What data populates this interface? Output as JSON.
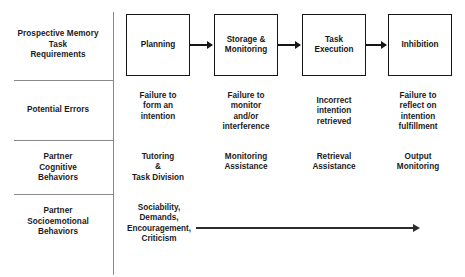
{
  "diagram": {
    "row_labels": [
      {
        "id": "pm-task-requirements",
        "text": "Prospective Memory\nTask\nRequirements"
      },
      {
        "id": "potential-errors",
        "text": "Potential Errors"
      },
      {
        "id": "partner-cognitive-behaviors",
        "text": "Partner\nCognitive\nBehaviors"
      },
      {
        "id": "partner-socioemotional-behaviors",
        "text": "Partner\nSocioemotional\nBehaviors"
      }
    ],
    "stages": [
      {
        "id": "planning",
        "label": "Planning"
      },
      {
        "id": "storage-monitoring",
        "label": "Storage &\nMonitoring"
      },
      {
        "id": "task-execution",
        "label": "Task\nExecution"
      },
      {
        "id": "inhibition",
        "label": "Inhibition"
      }
    ],
    "potential_errors": [
      "Failure to\nform an\nintention",
      "Failure to\nmonitor\nand/or\ninterference",
      "Incorrect\nintention\nretrieved",
      "Failure to\nreflect on\nintention\nfulfillment"
    ],
    "partner_cognitive_behaviors": [
      "Tutoring\n&\nTask Division",
      "Monitoring\nAssistance",
      "Retrieval\nAssistance",
      "Output\nMonitoring"
    ],
    "partner_socioemotional_behaviors": [
      "Sociability,\nDemands,\nEncouragement,\nCriticism"
    ],
    "colors": {
      "background": "#ffffff",
      "box_border": "#161616",
      "text": "#1b1b1b",
      "divider": "#8a8a8a",
      "arrow": "#2b2b2b"
    }
  }
}
